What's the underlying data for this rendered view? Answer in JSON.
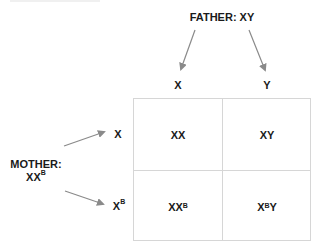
{
  "father": {
    "label": "FATHER: XY",
    "alleles": [
      "X",
      "Y"
    ]
  },
  "mother": {
    "label_line1": "MOTHER:",
    "label_base": "XX",
    "label_sup": "B",
    "alleles": [
      {
        "base": "X",
        "sup": ""
      },
      {
        "base": "X",
        "sup": "B"
      }
    ]
  },
  "grid": {
    "cells": [
      [
        {
          "base": "XX",
          "sup": "",
          "tail": ""
        },
        {
          "base": "XY",
          "sup": "",
          "tail": ""
        }
      ],
      [
        {
          "base": "XX",
          "sup": "B",
          "tail": ""
        },
        {
          "base": "X",
          "sup": "B",
          "tail": "Y"
        }
      ]
    ]
  },
  "colors": {
    "arrow": "#8a8a8a",
    "grid_line": "#d6d6d6",
    "text": "#1a1a1a"
  }
}
